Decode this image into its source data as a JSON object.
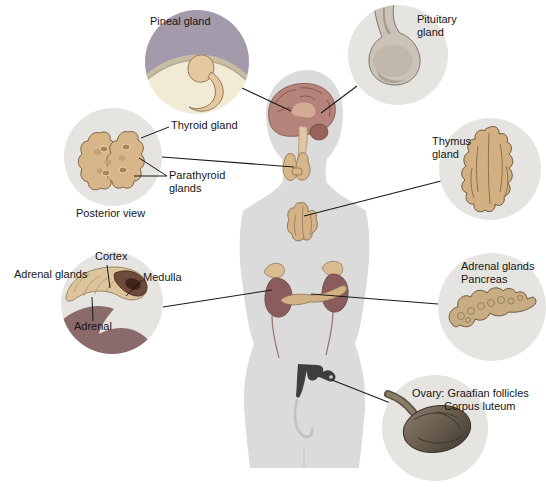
{
  "diagram": {
    "labels": {
      "pineal": "Pineal gland",
      "pituitary": "Pituitary gland",
      "thyroid": "Thyroid gland",
      "parathyroid": "Parathyroid glands",
      "posterior_view": "Posterior view",
      "thymus": "Thymus gland",
      "cortex": "Cortex",
      "adrenal_glands_left": "Adrenal glands",
      "medulla": "Medulla",
      "adrenal": "Adrenal",
      "adrenal_glands_right": "Adrenal glands",
      "pancreas": "Pancreas",
      "ovary": "Ovary: Graafian follicles",
      "corpus_luteum": "Corpus luteum"
    },
    "colors": {
      "background": "#ffffff",
      "body_silhouette": "#dbdbdb",
      "inset_circle": "#e6e4e1",
      "gland_tan": "#d7b78a",
      "pineal_backdrop_purple": "#a39aab",
      "pineal_cream": "#f1ead5",
      "pituitary_gray": "#cbc2b8",
      "brain": "#b5837a",
      "thymus_tan": "#d2b082",
      "kidney_maroon": "#8a5c5c",
      "adrenal_cortex": "#dcc49c",
      "medulla_dark_red": "#6e4a3a",
      "pancreas_tan": "#c9ad82",
      "ovary_dark": "#5f554a",
      "uterus_dark": "#3f3e3c",
      "leader_line": "#1a1a1a"
    }
  }
}
